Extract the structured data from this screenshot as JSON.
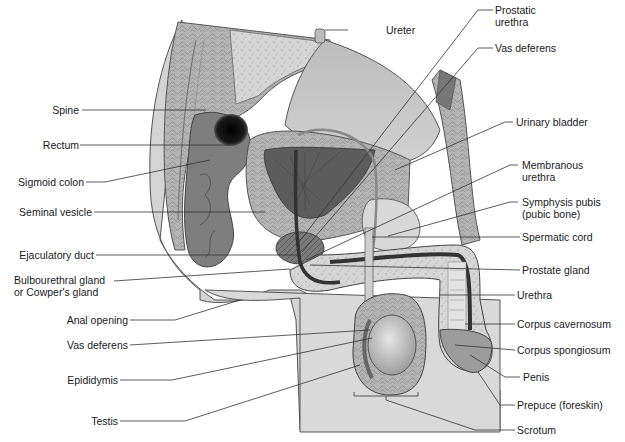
{
  "figure": {
    "background": "#ffffff",
    "colors": {
      "body_skin": "#d4d4d4",
      "tissue_light": "#c7c7c7",
      "tissue_mid": "#a9a9a9",
      "tissue_dark": "#6e6e6e",
      "cavity_dark": "#111111",
      "leader_line": "#333333"
    }
  },
  "labels_left": [
    {
      "id": "spine",
      "text": "Spine"
    },
    {
      "id": "rectum",
      "text": "Rectum"
    },
    {
      "id": "sigmoid-colon",
      "text": "Sigmoid colon"
    },
    {
      "id": "seminal-vesicle",
      "text": "Seminal vesicle"
    },
    {
      "id": "ejaculatory-duct",
      "text": "Ejaculatory duct"
    },
    {
      "id": "bulbourethral-gland",
      "text": "Bulbourethral gland\nor Cowper's gland"
    },
    {
      "id": "anal-opening",
      "text": "Anal opening"
    },
    {
      "id": "vas-deferens-left",
      "text": "Vas deferens"
    },
    {
      "id": "epididymis",
      "text": "Epididymis"
    },
    {
      "id": "testis",
      "text": "Testis"
    }
  ],
  "labels_top": [
    {
      "id": "ureter",
      "text": "Ureter"
    }
  ],
  "labels_right": [
    {
      "id": "prostatic-urethra",
      "text": "Prostatic\nurethra"
    },
    {
      "id": "vas-deferens-right",
      "text": "Vas deferens"
    },
    {
      "id": "urinary-bladder",
      "text": "Urinary bladder"
    },
    {
      "id": "membranous-urethra",
      "text": "Membranous\nurethra"
    },
    {
      "id": "symphysis-pubis",
      "text": "Symphysis pubis\n(pubic bone)"
    },
    {
      "id": "spermatic-cord",
      "text": "Spermatic cord"
    },
    {
      "id": "prostate-gland",
      "text": "Prostate gland"
    },
    {
      "id": "urethra",
      "text": "Urethra"
    },
    {
      "id": "corpus-cavernosum",
      "text": "Corpus cavernosum"
    },
    {
      "id": "corpus-spongiosum",
      "text": "Corpus spongiosum"
    },
    {
      "id": "penis",
      "text": "Penis"
    },
    {
      "id": "prepuce",
      "text": "Prepuce (foreskin)"
    },
    {
      "id": "scrotum",
      "text": "Scrotum"
    }
  ]
}
